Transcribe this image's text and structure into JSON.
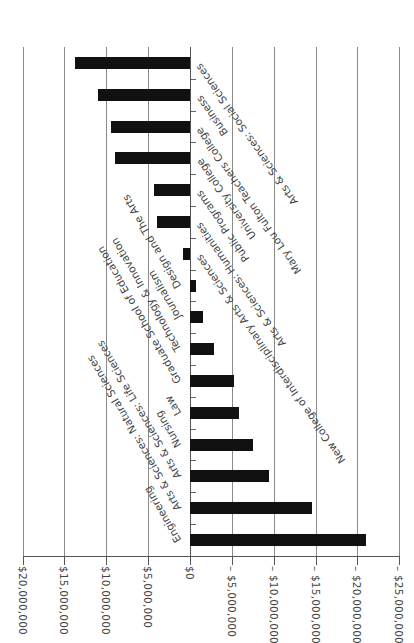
{
  "chart_data": {
    "type": "bar",
    "orientation": "horizontal",
    "title": "",
    "xlabel": "",
    "ylabel": "",
    "categories": [
      "Arts & Sciences: Social Sciences",
      "Business",
      "Mary Lou Fulton Teachers College",
      "University College",
      "Public Programs",
      "Arts & Sciences: Humanities",
      "New College of Interdisciplinary Arts & Sciences",
      "Design and The Arts",
      "Journalism",
      "Technology & Innovation",
      "Graduate School of Education",
      "Law",
      "Nursing",
      "Arts & Sciences: Life Sciences",
      "Arts & Sciences: Natural Sciences",
      "Engineering"
    ],
    "values": [
      13700000,
      11000000,
      9400000,
      9000000,
      4300000,
      4000000,
      800000,
      -700000,
      -1600000,
      -2900000,
      -5200000,
      -5800000,
      -7500000,
      -9400000,
      -14600000,
      -21000000
    ],
    "xlim": [
      20000000,
      -25000000
    ],
    "tick_values": [
      20000000,
      15000000,
      10000000,
      5000000,
      0,
      -5000000,
      -10000000,
      -15000000,
      -20000000,
      -25000000
    ],
    "tick_labels": [
      "$20,000,000",
      "$15,000,000",
      "$10,000,000",
      "$5,000,000",
      "$0",
      "– $5,000,000",
      "– $10,000,000",
      "– $15,000,000",
      "– $20,000,000",
      "– $25,000,000"
    ],
    "grid": true,
    "legend": "none",
    "bar_color": "#111111"
  }
}
